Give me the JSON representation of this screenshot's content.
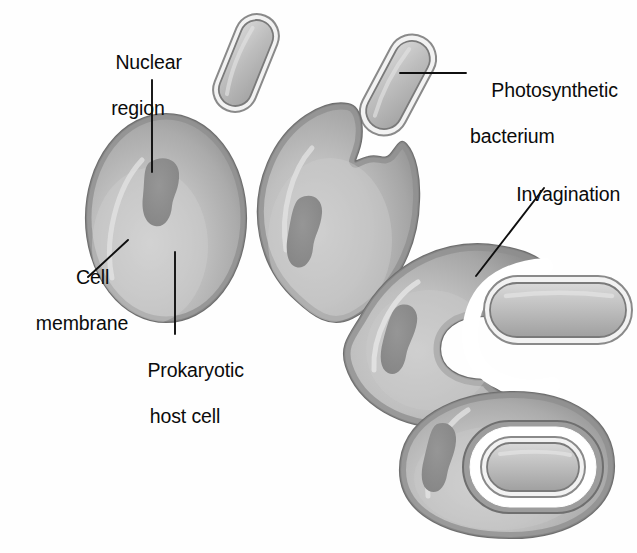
{
  "figure": {
    "type": "biological-process-diagram",
    "background_color": "#fefefe",
    "palette": {
      "cell_fill_light": "#c9c9c9",
      "cell_fill_mid": "#a9a9a9",
      "cell_fill_dark": "#8f8f8f",
      "cell_outline": "#6e6e6e",
      "nuclear_region": "#8a8a8a",
      "bacterium_fill": "#b4b4b4",
      "bacterium_outline": "#7a7a7a",
      "vesicle_space": "#ffffff",
      "leader_line": "#0f0f0f",
      "text": "#0b0b0b"
    }
  },
  "labels": {
    "nuclear_region": {
      "line1": "Nuclear",
      "line2": "region"
    },
    "photosynthetic_bacterium": {
      "line1": "Photosynthetic",
      "line2": "bacterium"
    },
    "cell_membrane": {
      "line1": "Cell",
      "line2": "membrane"
    },
    "prokaryotic_host_cell": {
      "line1": "Prokaryotic",
      "line2": "host cell"
    },
    "invagination": {
      "line1": "Invagination",
      "line2": ""
    }
  },
  "stages": [
    {
      "id": "stage-1",
      "name": "free-host-cell-and-free-bacterium",
      "description": "Prokaryotic host cell with nuclear region; a free photosynthetic bacterium nearby"
    },
    {
      "id": "stage-2",
      "name": "membrane-notch-forming",
      "description": "Host cell membrane begins to indent toward the bacterium"
    },
    {
      "id": "stage-3",
      "name": "invagination-engulfing",
      "description": "Deep invagination of the host cell membrane surrounds the bacterium"
    },
    {
      "id": "stage-4",
      "name": "bacterium-enclosed-in-vesicle",
      "description": "Bacterium fully enclosed within a membrane-bound vesicle inside the host cell"
    }
  ]
}
